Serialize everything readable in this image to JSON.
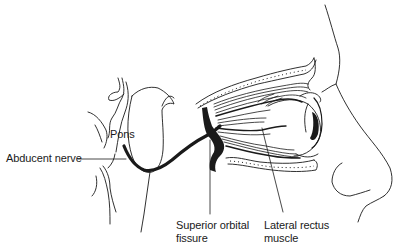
{
  "diagram": {
    "colors": {
      "ink": "#1a1a1a",
      "background": "#ffffff"
    },
    "labels": {
      "pons": "Pons",
      "abducent_nerve": "Abducent nerve",
      "superior_orbital_fissure_line1": "Superior orbital",
      "superior_orbital_fissure_line2": "fissure",
      "lateral_rectus_line1": "Lateral rectus",
      "lateral_rectus_line2": "muscle"
    },
    "structures": [
      "brainstem",
      "pons",
      "abducent-nerve",
      "superior-orbital-fissure",
      "orbit",
      "extraocular-muscles",
      "eyeball",
      "face-profile",
      "nose"
    ]
  }
}
